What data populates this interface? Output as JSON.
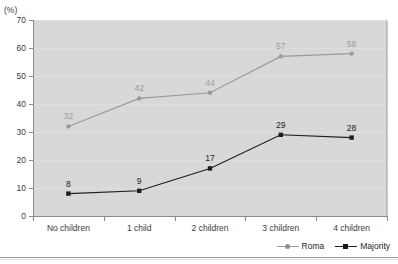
{
  "unit_label": "(%)",
  "top_clipped_text": "",
  "chart_data": {
    "type": "line",
    "title": "",
    "xlabel": "",
    "ylabel": "",
    "unit": "(%)",
    "ylim": [
      0,
      70
    ],
    "yticks": [
      0,
      10,
      20,
      30,
      40,
      50,
      60,
      70
    ],
    "ytick_labels": [
      "0",
      "10",
      "20",
      "30",
      "40",
      "50",
      "60",
      "70"
    ],
    "grid": true,
    "legend_position": "bottom-right",
    "categories": [
      "No children",
      "1 child",
      "2 children",
      "3 children",
      "4 children"
    ],
    "series": [
      {
        "name": "Roma",
        "color": "#9a9a9a",
        "marker": "circle",
        "values": [
          32,
          42,
          44,
          57,
          58
        ],
        "labels": [
          "32",
          "42",
          "44",
          "57",
          "58"
        ]
      },
      {
        "name": "Majority",
        "color": "#1d1d1d",
        "marker": "square",
        "values": [
          8,
          9,
          17,
          29,
          28
        ],
        "labels": [
          "8",
          "9",
          "17",
          "29",
          "28"
        ]
      }
    ]
  },
  "legend": {
    "items": [
      {
        "label": "Roma"
      },
      {
        "label": "Majority"
      }
    ]
  },
  "colors": {
    "plot_background": "#d8d8d8",
    "roma": "#9a9a9a",
    "majority": "#1d1d1d",
    "axis": "#8a8a8a",
    "text": "#3b3b3b"
  }
}
